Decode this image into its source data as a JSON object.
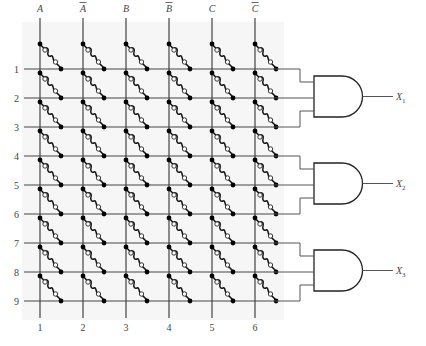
{
  "figure": {
    "input_columns": [
      {
        "label": "A",
        "overbar": false,
        "number": "1"
      },
      {
        "label": "A",
        "overbar": true,
        "number": "2"
      },
      {
        "label": "B",
        "overbar": false,
        "number": "3"
      },
      {
        "label": "B",
        "overbar": true,
        "number": "4"
      },
      {
        "label": "C",
        "overbar": false,
        "number": "5"
      },
      {
        "label": "C",
        "overbar": true,
        "number": "6"
      }
    ],
    "rows": [
      "1",
      "2",
      "3",
      "4",
      "5",
      "6",
      "7",
      "8",
      "9"
    ],
    "gates": [
      {
        "type": "AND",
        "inputs_rows": [
          "1",
          "2",
          "3"
        ],
        "output": "X",
        "subscript": "1"
      },
      {
        "type": "AND",
        "inputs_rows": [
          "4",
          "5",
          "6"
        ],
        "output": "X",
        "subscript": "2"
      },
      {
        "type": "AND",
        "inputs_rows": [
          "7",
          "8",
          "9"
        ],
        "output": "X",
        "subscript": "3"
      }
    ],
    "fuse_link": "intact fuse at every row/column crossing"
  }
}
